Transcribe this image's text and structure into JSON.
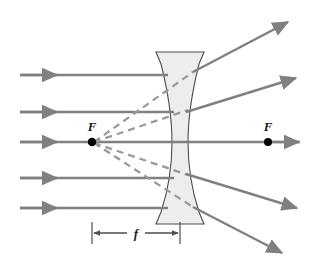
{
  "figure": {
    "type": "optics-ray-diagram",
    "width": 322,
    "height": 267,
    "background_color": "#ffffff"
  },
  "colors": {
    "ray": "#808080",
    "virtual_ray": "#9a9a9a",
    "lens_outline": "#4d4d4d",
    "lens_fill": "#ededed",
    "axis": "#808080",
    "dot": "#000000",
    "dimension": "#4d4d4d",
    "text": "#1a1a1a"
  },
  "labels": {
    "focal_point_left": "F",
    "focal_point_right": "F",
    "focal_length": "f"
  },
  "lens": {
    "name": "biconcave-diverging-lens",
    "center_x": 180,
    "top_y": 52,
    "bottom_y": 224,
    "flange_half_width": 24,
    "waist_half_width": 8,
    "fill": "#ededed",
    "outline": "#4d4d4d"
  },
  "optical_axis": {
    "y": 142,
    "x_start": 20,
    "x_end": 300
  },
  "focal_points": [
    {
      "name": "near-focal-point",
      "label": "F",
      "x": 92,
      "y": 142,
      "label_x": 92,
      "label_y": 130
    },
    {
      "name": "far-focal-point",
      "label": "F",
      "x": 268,
      "y": 142,
      "label_x": 268,
      "label_y": 130
    }
  ],
  "focal_length_dimension": {
    "label": "f",
    "y": 233,
    "x_left": 92,
    "x_right": 180,
    "label_x": 136,
    "label_y": 238
  },
  "incident_rays": [
    {
      "name": "incident-ray-1",
      "y": 75,
      "x_start": 20,
      "x_end": 168,
      "arrow_x": 56
    },
    {
      "name": "incident-ray-2",
      "y": 112,
      "x_start": 20,
      "x_end": 174,
      "arrow_x": 56
    },
    {
      "name": "incident-ray-3",
      "y": 142,
      "x_start": 20,
      "x_end": 300,
      "arrow_x": 56
    },
    {
      "name": "incident-ray-4",
      "y": 178,
      "x_start": 20,
      "x_end": 174,
      "arrow_x": 56
    },
    {
      "name": "incident-ray-5",
      "y": 208,
      "x_start": 20,
      "x_end": 168,
      "arrow_x": 56
    }
  ],
  "refracted_rays": [
    {
      "name": "refracted-ray-1",
      "x1": 193,
      "y1": 72,
      "x2": 288,
      "y2": 22
    },
    {
      "name": "refracted-ray-2",
      "x1": 188,
      "y1": 110,
      "x2": 295,
      "y2": 78
    },
    {
      "name": "refracted-ray-3",
      "x1": 268,
      "y1": 142,
      "x2": 300,
      "y2": 142
    },
    {
      "name": "refracted-ray-4",
      "x1": 188,
      "y1": 175,
      "x2": 297,
      "y2": 208
    },
    {
      "name": "refracted-ray-5",
      "x1": 193,
      "y1": 207,
      "x2": 282,
      "y2": 253
    }
  ],
  "virtual_rays": [
    {
      "name": "virtual-ray-1",
      "x1": 92,
      "y1": 142,
      "x2": 193,
      "y2": 72
    },
    {
      "name": "virtual-ray-2",
      "x1": 92,
      "y1": 142,
      "x2": 188,
      "y2": 110
    },
    {
      "name": "virtual-ray-3",
      "x1": 92,
      "y1": 142,
      "x2": 188,
      "y2": 175
    },
    {
      "name": "virtual-ray-4",
      "x1": 92,
      "y1": 142,
      "x2": 193,
      "y2": 207
    }
  ]
}
